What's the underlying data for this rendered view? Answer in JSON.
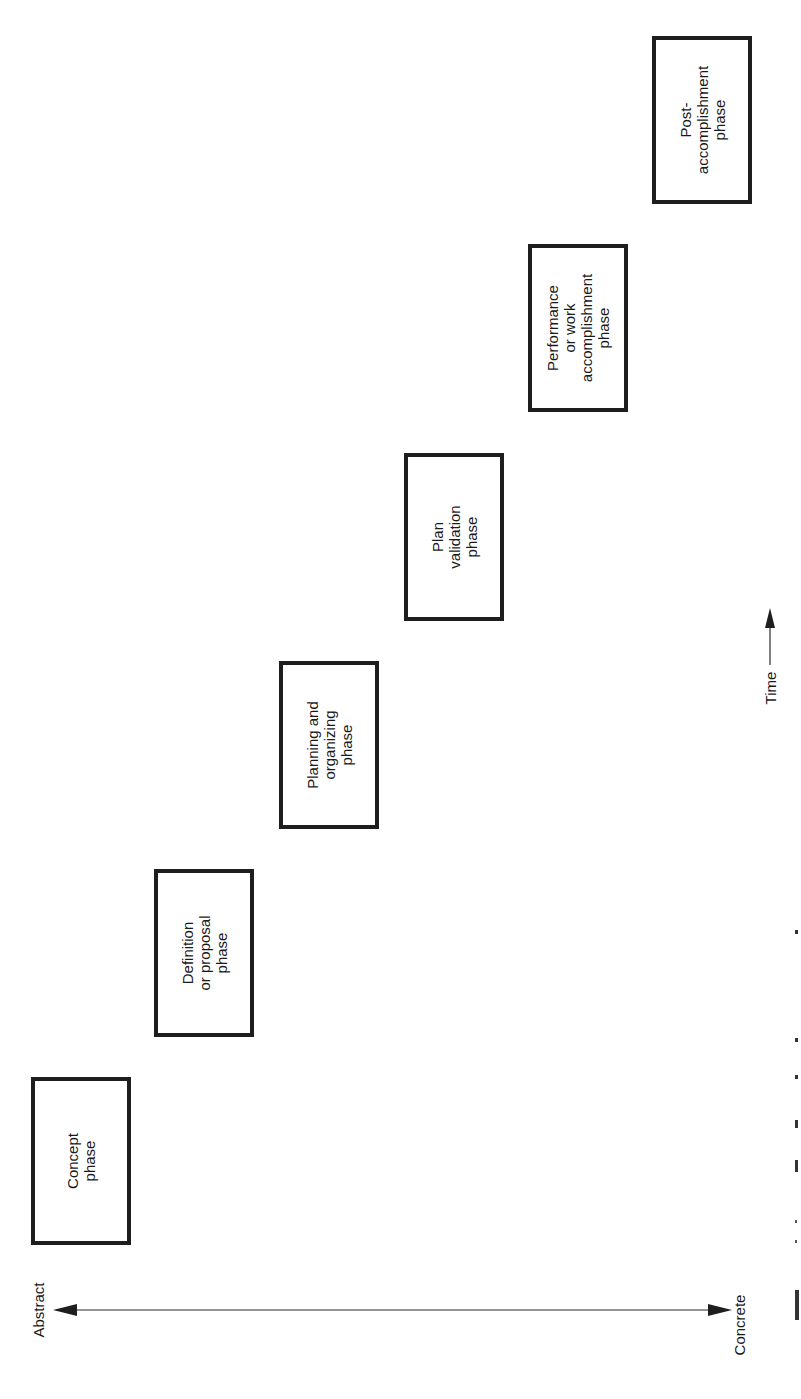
{
  "diagram": {
    "orientation": "rotated 90deg counter-clockwise (landscape figure on portrait page)",
    "phases": [
      {
        "label": "Concept\nphase",
        "order": 1
      },
      {
        "label": "Definition\nor proposal\nphase",
        "order": 2
      },
      {
        "label": "Planning and\norganizing\nphase",
        "order": 3
      },
      {
        "label": "Plan\nvalidation\nphase",
        "order": 4
      },
      {
        "label": "Performance\nor work\naccomplishment\nphase",
        "order": 5
      },
      {
        "label": "Post-\naccomplishment\nphase",
        "order": 6
      }
    ],
    "axis": {
      "left_label": "Abstract",
      "right_label": "Concrete",
      "type": "double-headed arrow"
    },
    "time_axis": {
      "label": "Time",
      "arrow": "right"
    },
    "caption": {
      "visible": "partially cut off at right edge",
      "text": ""
    }
  },
  "colors": {
    "ink": "#1e1e1e",
    "background": "#ffffff"
  }
}
